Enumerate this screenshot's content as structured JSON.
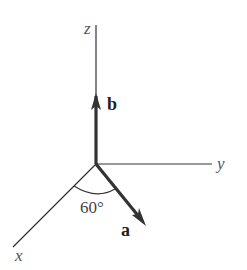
{
  "diagram": {
    "type": "3d-vector-axes",
    "axes": {
      "z": {
        "label": "z"
      },
      "y": {
        "label": "y"
      },
      "x": {
        "label": "x"
      }
    },
    "vectors": [
      {
        "name": "b",
        "label": "b",
        "direction": "along positive z-axis"
      },
      {
        "name": "a",
        "label": "a",
        "direction": "in xy-plane, 60° from x-axis"
      }
    ],
    "angle": {
      "label": "60°",
      "between": [
        "x-axis",
        "a"
      ]
    },
    "colors": {
      "axis": "#333333",
      "vector": "#333333",
      "background": "#ffffff"
    }
  }
}
